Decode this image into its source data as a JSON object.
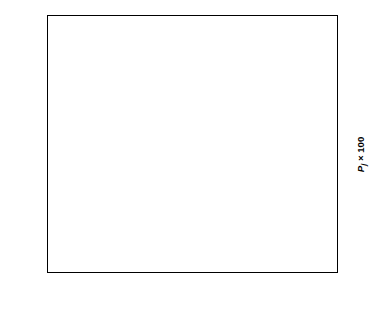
{
  "chart_data": {
    "type": "scatter",
    "title": "",
    "xlabel": "Effect estimate",
    "ylabel_left": "Normal probability, (1 − Pj) × 100",
    "ylabel_right": "Pj × 100",
    "xlim": [
      -0.072,
      1.2
    ],
    "ylim_left_scale": "normal-probability",
    "grid": false,
    "legend": "none",
    "xticks": [
      "0",
      "0.3",
      "0.6",
      "0.9",
      "1.2"
    ],
    "xtick_values": [
      0,
      0.3,
      0.6,
      0.9,
      1.2
    ],
    "yticks_left": [
      "1",
      "5",
      "10",
      "20",
      "30",
      "50",
      "70",
      "80",
      "90",
      "95",
      "99"
    ],
    "ytick_values_left": [
      1,
      5,
      10,
      20,
      30,
      50,
      70,
      80,
      90,
      95,
      99
    ],
    "yticks_right": [
      "99",
      "95",
      "90",
      "80",
      "70",
      "50",
      "30",
      "20",
      "10",
      "5",
      "1"
    ],
    "ytick_values_right": [
      99,
      95,
      90,
      80,
      70,
      50,
      30,
      20,
      10,
      5,
      1
    ],
    "points": [
      {
        "x": -0.042,
        "y_left": 96.5,
        "label": ""
      },
      {
        "x": -0.03,
        "y_left": 90.5,
        "label": ""
      },
      {
        "x": -0.003,
        "y_left": 83.0,
        "label": ""
      },
      {
        "x": 0.005,
        "y_left": 79.0,
        "label": ""
      },
      {
        "x": 0.014,
        "y_left": 73.5,
        "label": ""
      },
      {
        "x": 0.022,
        "y_left": 69.0,
        "label": ""
      },
      {
        "x": 0.034,
        "y_left": 63.0,
        "label": ""
      },
      {
        "x": 0.046,
        "y_left": 57.5,
        "label": ""
      },
      {
        "x": 0.058,
        "y_left": 52.0,
        "label": ""
      },
      {
        "x": 0.07,
        "y_left": 46.5,
        "label": ""
      },
      {
        "x": 0.082,
        "y_left": 41.5,
        "label": ""
      },
      {
        "x": 0.095,
        "y_left": 36.5,
        "label": ""
      },
      {
        "x": 0.112,
        "y_left": 31.0,
        "label": ""
      },
      {
        "x": 0.13,
        "y_left": 26.0,
        "label": ""
      },
      {
        "x": 0.175,
        "y_left": 22.0,
        "label": ""
      },
      {
        "x": 0.34,
        "y_left": 15.5,
        "label": "D"
      },
      {
        "x": 0.58,
        "y_left": 10.5,
        "label": "C"
      },
      {
        "x": 1.15,
        "y_left": 4.0,
        "label": "B"
      }
    ],
    "fit_line": {
      "x1": 0.0,
      "y1_left": 88.0,
      "x2": 0.262,
      "y2_left": 1.4
    }
  },
  "colors": {
    "axis": "#000000",
    "marker": "#000000",
    "line": "#000000",
    "background": "#ffffff"
  }
}
